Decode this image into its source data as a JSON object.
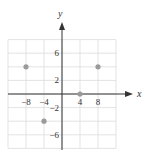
{
  "chart_data": {
    "type": "scatter",
    "title": "",
    "xlabel": "x",
    "ylabel": "y",
    "xlim": [
      -12,
      12
    ],
    "ylim": [
      -8,
      8
    ],
    "grid": true,
    "x_grid_step": 4,
    "y_grid_step": 2,
    "x_tick_labels": [
      "-8",
      "-4",
      "4",
      "8"
    ],
    "x_tick_values": [
      -8,
      -4,
      4,
      8
    ],
    "y_tick_labels": [
      "6",
      "2",
      "-2",
      "-6"
    ],
    "y_tick_values": [
      6,
      2,
      -2,
      -6
    ],
    "points": [
      {
        "x": -8,
        "y": 4
      },
      {
        "x": 8,
        "y": 4
      },
      {
        "x": 4,
        "y": 0
      },
      {
        "x": -4,
        "y": -4
      }
    ],
    "colors": {
      "point": "#9a9a9a",
      "grid": "#dcdcdc",
      "axis": "#333333"
    }
  }
}
